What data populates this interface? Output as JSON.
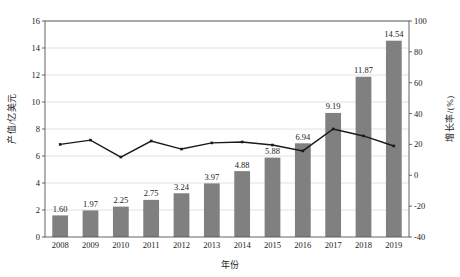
{
  "chart_data": {
    "type": "bar",
    "title": "",
    "subtitle": "",
    "xlabel": "年份",
    "ylabel": "产值/亿美元",
    "y2label": "增长率/(%)",
    "categories": [
      "2008",
      "2009",
      "2010",
      "2011",
      "2012",
      "2013",
      "2014",
      "2015",
      "2016",
      "2017",
      "2018",
      "2019"
    ],
    "ylim": [
      0,
      16
    ],
    "y2lim": [
      -40,
      100
    ],
    "yticks": [
      0,
      2,
      4,
      6,
      8,
      10,
      12,
      14,
      16
    ],
    "ytick_labels": [
      "0",
      "2",
      "4",
      "6",
      "8",
      "10",
      "12",
      "14",
      "16"
    ],
    "y2ticks": [
      -40,
      -20,
      0,
      20,
      40,
      60,
      80,
      100
    ],
    "y2tick_labels": [
      "-40",
      "-20",
      "0",
      "20",
      "40",
      "60",
      "80",
      "100"
    ],
    "grid": true,
    "legend_position": "none",
    "series": [
      {
        "name": "产值",
        "type": "bar",
        "axis": "left",
        "color": "#808080",
        "values": [
          1.6,
          1.97,
          2.25,
          2.75,
          3.24,
          3.97,
          4.88,
          5.88,
          6.94,
          9.19,
          11.87,
          14.54
        ],
        "data_labels": [
          "1.60",
          "1.97",
          "2.25",
          "2.75",
          "3.24",
          "3.97",
          "4.88",
          "5.88",
          "6.94",
          "9.19",
          "11.87",
          "14.54"
        ]
      },
      {
        "name": "增长率",
        "type": "line",
        "axis": "right",
        "color": "#1a1a1a",
        "marker": "square",
        "values": [
          20.0,
          22.8,
          11.8,
          22.2,
          17.0,
          21.0,
          21.6,
          19.6,
          15.8,
          30.0,
          25.5,
          19.0
        ]
      }
    ]
  }
}
